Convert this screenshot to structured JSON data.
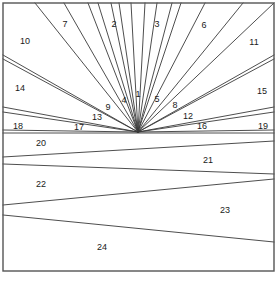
{
  "figure": {
    "kind": "line-diagram",
    "background_color": "#ffffff",
    "line_color": "#3a3a3a",
    "frame_color": "#555555",
    "label_color": "#1a1a1a",
    "width": 279,
    "height": 281
  },
  "frame": {
    "x": 3,
    "y": 3,
    "width": 271,
    "height": 268
  },
  "geometry": {
    "fan_apex": {
      "x": 138,
      "y": 132
    },
    "fan_band_bottom_y": 133,
    "comment_rays": "each ray runs from the fan apex outward to a point on the frame boundary",
    "rays": [
      {
        "id": "r1",
        "to_x": 131,
        "to_y": 3
      },
      {
        "id": "r2",
        "to_x": 145,
        "to_y": 3
      },
      {
        "id": "r3",
        "to_x": 119,
        "to_y": 3
      },
      {
        "id": "r4",
        "to_x": 157,
        "to_y": 3
      },
      {
        "id": "r5",
        "to_x": 111,
        "to_y": 3
      },
      {
        "id": "r6",
        "to_x": 88,
        "to_y": 3
      },
      {
        "id": "r7",
        "to_x": 98,
        "to_y": 3
      },
      {
        "id": "r8",
        "to_x": 172,
        "to_y": 3
      },
      {
        "id": "r9",
        "to_x": 181,
        "to_y": 3
      },
      {
        "id": "r10",
        "to_x": 205,
        "to_y": 3
      },
      {
        "id": "r11",
        "to_x": 64,
        "to_y": 3
      },
      {
        "id": "r12",
        "to_x": 35,
        "to_y": 3
      },
      {
        "id": "r13",
        "to_x": 243,
        "to_y": 3
      },
      {
        "id": "r14",
        "to_x": 274,
        "to_y": 3
      },
      {
        "id": "r15",
        "to_x": 3,
        "to_y": 55
      },
      {
        "id": "r16",
        "to_x": 3,
        "to_y": 59
      },
      {
        "id": "r17",
        "to_x": 274,
        "to_y": 55
      },
      {
        "id": "r18",
        "to_x": 274,
        "to_y": 59
      },
      {
        "id": "r19",
        "to_x": 3,
        "to_y": 107
      },
      {
        "id": "r20",
        "to_x": 3,
        "to_y": 112
      },
      {
        "id": "r21",
        "to_x": 274,
        "to_y": 107
      },
      {
        "id": "r22",
        "to_x": 274,
        "to_y": 112
      },
      {
        "id": "r23",
        "to_x": 3,
        "to_y": 130
      },
      {
        "id": "r24",
        "to_x": 274,
        "to_y": 130
      }
    ],
    "strip_dividers": [
      {
        "id": "d20-21",
        "left_y": 157,
        "right_y": 141
      },
      {
        "id": "d21-22",
        "left_y": 164,
        "right_y": 174
      },
      {
        "id": "d22-23",
        "left_y": 205,
        "right_y": 179
      },
      {
        "id": "d23-24",
        "left_y": 215,
        "right_y": 242
      }
    ]
  },
  "labels": [
    {
      "text": "1",
      "x": 138,
      "y": 95
    },
    {
      "text": "2",
      "x": 114,
      "y": 25
    },
    {
      "text": "3",
      "x": 157,
      "y": 25
    },
    {
      "text": "4",
      "x": 124,
      "y": 101
    },
    {
      "text": "5",
      "x": 157,
      "y": 100
    },
    {
      "text": "6",
      "x": 204,
      "y": 26
    },
    {
      "text": "7",
      "x": 65,
      "y": 25
    },
    {
      "text": "8",
      "x": 175,
      "y": 106
    },
    {
      "text": "9",
      "x": 108,
      "y": 108
    },
    {
      "text": "10",
      "x": 25,
      "y": 42
    },
    {
      "text": "11",
      "x": 254,
      "y": 43
    },
    {
      "text": "12",
      "x": 188,
      "y": 117
    },
    {
      "text": "13",
      "x": 97,
      "y": 118
    },
    {
      "text": "14",
      "x": 20,
      "y": 89
    },
    {
      "text": "15",
      "x": 262,
      "y": 92
    },
    {
      "text": "16",
      "x": 202,
      "y": 127
    },
    {
      "text": "17",
      "x": 79,
      "y": 128
    },
    {
      "text": "18",
      "x": 18,
      "y": 127
    },
    {
      "text": "19",
      "x": 263,
      "y": 127
    },
    {
      "text": "20",
      "x": 41,
      "y": 144
    },
    {
      "text": "21",
      "x": 208,
      "y": 161
    },
    {
      "text": "22",
      "x": 41,
      "y": 185
    },
    {
      "text": "23",
      "x": 225,
      "y": 211
    },
    {
      "text": "24",
      "x": 102,
      "y": 248
    }
  ]
}
